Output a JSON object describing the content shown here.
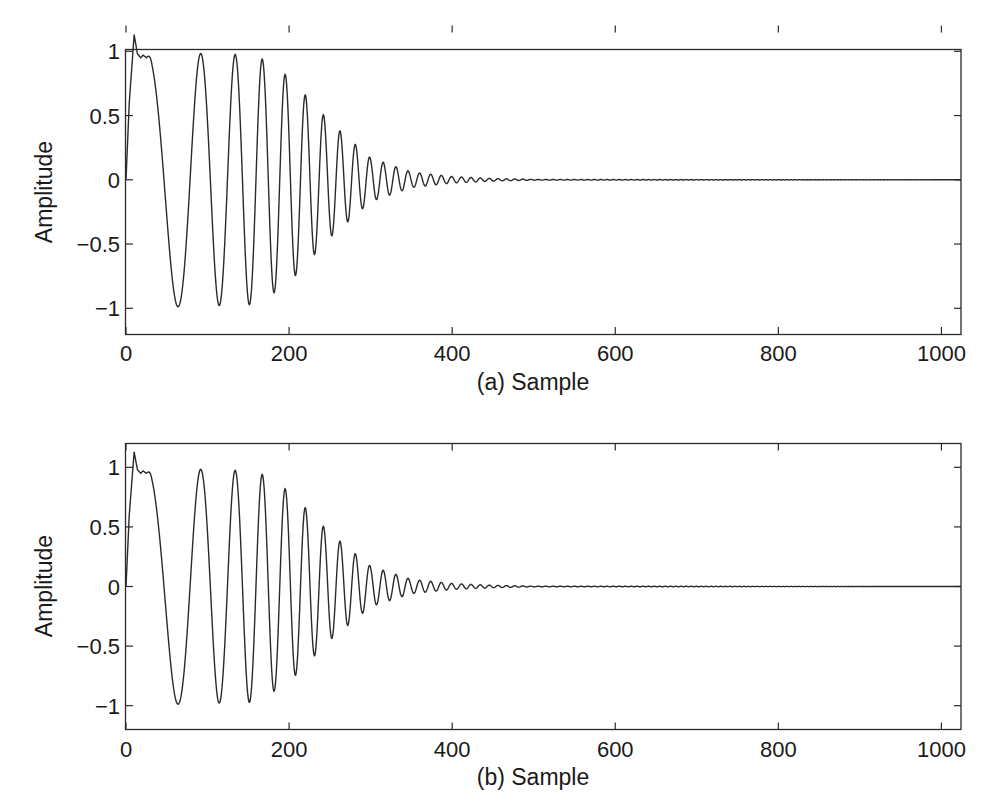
{
  "chart_data": [
    {
      "id": "a",
      "type": "line",
      "title": "",
      "xlabel": "(a) Sample",
      "ylabel": "Amplitude",
      "xlim": [
        0,
        1024
      ],
      "ylim": [
        -1.2,
        1.2
      ],
      "xticks": [
        0,
        200,
        400,
        600,
        800,
        1000
      ],
      "xtick_labels": [
        "0",
        "200",
        "400",
        "600",
        "800",
        "1000"
      ],
      "yticks": [
        1,
        0.5,
        0,
        -0.5,
        -1
      ],
      "ytick_labels": [
        "1",
        "0.5",
        "0",
        "−0.5",
        "−1"
      ],
      "grid": false,
      "legend": null,
      "line_color": "#2a2a2a",
      "description": "Chirp signal with increasing frequency; unit amplitude up to ~sample 160, then decaying to ~0 by sample ~450; initial overshoot to ~1.13 near sample 10",
      "key_points": {
        "x": [
          0,
          10,
          18,
          25,
          50,
          68,
          84,
          96,
          107,
          117,
          126,
          142,
          155,
          200,
          250,
          300,
          350,
          400,
          450,
          500,
          1024
        ],
        "y": [
          0,
          1.13,
          0.95,
          0.97,
          -1,
          1,
          -1,
          1,
          -1,
          1,
          -1,
          -1,
          -1,
          0.8,
          0.45,
          0.15,
          0.05,
          0.02,
          0.01,
          0,
          0
        ]
      },
      "envelope": {
        "x": [
          0,
          160,
          200,
          250,
          300,
          350,
          400,
          450,
          500,
          1024
        ],
        "y": [
          1,
          0.97,
          0.8,
          0.45,
          0.17,
          0.06,
          0.025,
          0.01,
          0.003,
          0
        ]
      }
    },
    {
      "id": "b",
      "type": "line",
      "title": "",
      "xlabel": "(b) Sample",
      "ylabel": "Amplitude",
      "xlim": [
        0,
        1024
      ],
      "ylim": [
        -1.2,
        1.2
      ],
      "xticks": [
        0,
        200,
        400,
        600,
        800,
        1000
      ],
      "xtick_labels": [
        "0",
        "200",
        "400",
        "600",
        "800",
        "1000"
      ],
      "yticks": [
        1,
        0.5,
        0,
        -0.5,
        -1
      ],
      "ytick_labels": [
        "1",
        "0.5",
        "0",
        "−0.5",
        "−1"
      ],
      "grid": false,
      "legend": null,
      "line_color": "#2a2a2a",
      "description": "Nearly identical chirp signal to panel (a)",
      "key_points": {
        "x": [
          0,
          10,
          18,
          25,
          50,
          68,
          84,
          96,
          107,
          117,
          126,
          142,
          155,
          200,
          250,
          300,
          350,
          400,
          450,
          500,
          1024
        ],
        "y": [
          0,
          1.13,
          0.95,
          0.97,
          -1,
          1,
          -1,
          1,
          -1,
          1,
          -1,
          -1,
          -1,
          0.8,
          0.45,
          0.15,
          0.05,
          0.02,
          0.01,
          0,
          0
        ]
      },
      "envelope": {
        "x": [
          0,
          160,
          200,
          250,
          300,
          350,
          400,
          450,
          500,
          1024
        ],
        "y": [
          1,
          0.97,
          0.8,
          0.45,
          0.17,
          0.06,
          0.025,
          0.01,
          0.003,
          0
        ]
      }
    }
  ],
  "panels": [
    {
      "ylabel": "Amplitude",
      "xlabel": "(a) Sample"
    },
    {
      "ylabel": "Amplitude",
      "xlabel": "(b) Sample"
    }
  ]
}
